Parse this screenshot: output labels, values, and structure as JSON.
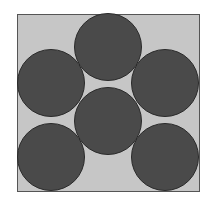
{
  "diagram": {
    "type": "circle-packing",
    "canvas": {
      "width": 209,
      "height": 201,
      "background": "#ffffff"
    },
    "square": {
      "x": 17,
      "y": 14,
      "width": 182,
      "height": 177,
      "fill": "#c6c6c6",
      "stroke": "#555555",
      "stroke_width": 1
    },
    "circle_style": {
      "fill": "#4a4a4a",
      "stroke": "#2a2a2a",
      "stroke_width": 1
    },
    "circles": [
      {
        "id": "top-center",
        "cx": 108,
        "cy": 47,
        "r": 33.5
      },
      {
        "id": "middle-left",
        "cx": 51,
        "cy": 83,
        "r": 33.5
      },
      {
        "id": "middle-right",
        "cx": 165,
        "cy": 83,
        "r": 33.5
      },
      {
        "id": "center",
        "cx": 108,
        "cy": 121,
        "r": 33.5
      },
      {
        "id": "bottom-left",
        "cx": 51,
        "cy": 157,
        "r": 33.5
      },
      {
        "id": "bottom-right",
        "cx": 165,
        "cy": 157,
        "r": 33.5
      }
    ]
  }
}
